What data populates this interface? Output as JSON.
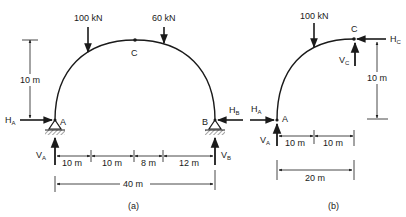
{
  "figure_a": {
    "caption": "(a)",
    "loads": [
      {
        "label": "100 kN",
        "x_pos_m": 10
      },
      {
        "label": "60 kN",
        "x_pos_m": 28
      }
    ],
    "crown_label": "C",
    "support_left": {
      "label": "A",
      "H": "H",
      "H_sub": "A",
      "V": "V",
      "V_sub": "A"
    },
    "support_right": {
      "label": "B",
      "H": "H",
      "H_sub": "B",
      "V": "V",
      "V_sub": "B"
    },
    "rise_dim": "10 m",
    "segment_dims": [
      "10 m",
      "10 m",
      "8 m",
      "12 m"
    ],
    "span_dim": "40 m"
  },
  "figure_b": {
    "caption": "(b)",
    "load": {
      "label": "100 kN"
    },
    "crown_label": "C",
    "crown_forces": {
      "H": "H",
      "H_sub": "C",
      "V": "V",
      "V_sub": "C"
    },
    "support": {
      "label": "A",
      "H": "H",
      "H_sub": "A",
      "V": "V",
      "V_sub": "A"
    },
    "rise_dim": "10 m",
    "segment_dims": [
      "10 m",
      "10 m"
    ],
    "span_dim": "20 m"
  }
}
